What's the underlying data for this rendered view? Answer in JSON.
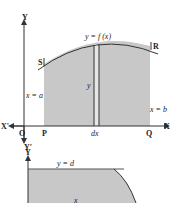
{
  "figure1": {
    "axis_y_label": "Y",
    "axis_x_label": "X",
    "axis_x_neg_label": "X'",
    "axis_y_neg_label": "Y'",
    "origin_label": "O",
    "curve_label": "y = f (x)",
    "point_s": "S",
    "point_r": "R",
    "point_p": "P",
    "point_q": "Q",
    "left_bound_label": "x = a",
    "right_bound_label": "x = b",
    "strip_height_label": "y",
    "strip_width_label": "dx",
    "fill_color": "#c8c8c8",
    "line_color": "#333333"
  },
  "figure2": {
    "axis_y_label": "Y",
    "top_bound_label": "y = d",
    "inner_label": "x",
    "fill_color": "#c8c8c8"
  }
}
